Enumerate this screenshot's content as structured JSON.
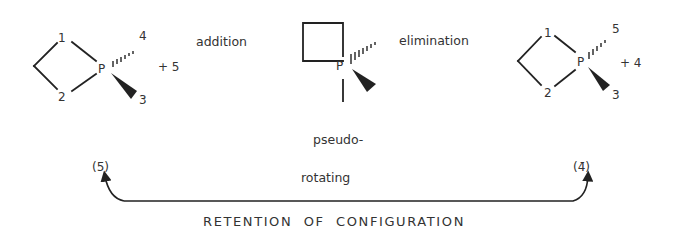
{
  "diagram": {
    "structures": [
      {
        "id": "reactant",
        "center_atom": "P",
        "ring_labels": [
          "1",
          "2"
        ],
        "hashed_substituent": "4",
        "wedged_substituent": "3",
        "plus_term": "+ 5"
      },
      {
        "id": "intermediate",
        "center_atom": "P",
        "label_top": "pseudo-",
        "label_bottom": "rotating"
      },
      {
        "id": "product",
        "center_atom": "P",
        "ring_labels": [
          "1",
          "2"
        ],
        "hashed_substituent": "5",
        "wedged_substituent": "3",
        "plus_term": "+ 4"
      }
    ],
    "steps": {
      "first": "addition",
      "second": "elimination"
    },
    "bracket_labels": {
      "left": "(5̄)",
      "right": "(4̄)"
    },
    "caption": "RETENTION  OF  CONFIGURATION"
  }
}
